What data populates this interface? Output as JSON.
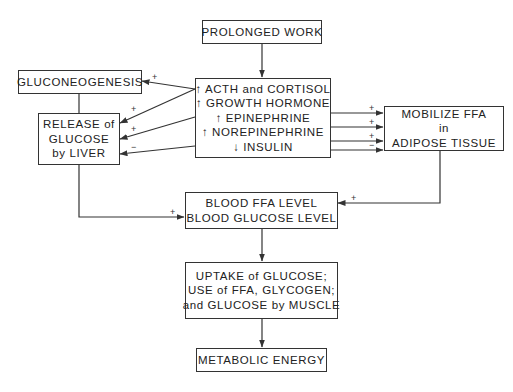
{
  "diagram": {
    "nodes": {
      "prolonged_work": {
        "lines": [
          "PROLONGED WORK"
        ]
      },
      "hormones": {
        "lines": [
          "↑ ACTH and CORTISOL",
          "↑ GROWTH HORMONE",
          "↑ EPINEPHRINE",
          "↑ NOREPINEPHRINE",
          "↓ INSULIN"
        ]
      },
      "gluconeogenesis": {
        "lines": [
          "GLUCONEOGENESIS"
        ]
      },
      "release_glucose": {
        "lines": [
          "RELEASE of",
          "GLUCOSE",
          "by LIVER"
        ]
      },
      "mobilize_ffa": {
        "lines": [
          "MOBILIZE FFA",
          "in",
          "ADIPOSE TISSUE"
        ]
      },
      "blood_levels": {
        "lines": [
          "BLOOD FFA LEVEL",
          "BLOOD GLUCOSE LEVEL"
        ]
      },
      "uptake": {
        "lines": [
          "UPTAKE of GLUCOSE;",
          "USE of FFA, GLYCOGEN;",
          "and GLUCOSE by MUSCLE"
        ]
      },
      "metabolic_energy": {
        "lines": [
          "METABOLIC ENERGY"
        ]
      }
    },
    "signs": {
      "to_gluconeogenesis": "+",
      "to_release_1": "+",
      "to_release_2": "+",
      "to_release_3": "−",
      "to_mobilize_1": "+",
      "to_mobilize_2": "+",
      "to_mobilize_3": "+",
      "to_mobilize_4": "−",
      "release_to_blood": "+",
      "mobilize_to_blood": "+"
    },
    "colors": {
      "line": "#333333",
      "background": "#ffffff"
    }
  }
}
